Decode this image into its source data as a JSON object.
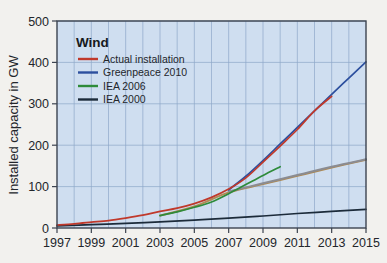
{
  "figure": {
    "background_color": "#f2f1ee",
    "plot_background_color": "#cfdef0",
    "frame_color": "#3c4450",
    "grid_color": "#8ea8c8"
  },
  "legend": {
    "title": "Wind",
    "position": "top-left-inside",
    "entries": [
      {
        "label": "Actual installation",
        "color": "#c0392b",
        "swatch_name": "legend-swatch-actual-installation"
      },
      {
        "label": "Greenpeace 2010",
        "color": "#2c4f9e",
        "swatch_name": "legend-swatch-greenpeace-2010"
      },
      {
        "label": "IEA 2006",
        "color": "#2e8b3a",
        "swatch_name": "legend-swatch-iea-2006"
      },
      {
        "label": "IEA 2000",
        "color": "#1c2b3a",
        "swatch_name": "legend-swatch-iea-2000"
      }
    ]
  },
  "chart_data": {
    "type": "line",
    "title": "Wind",
    "xlabel": "",
    "ylabel": "Installed capacity in GW",
    "xlim": [
      1997,
      2015
    ],
    "ylim": [
      0,
      500
    ],
    "grid": true,
    "legend_position": "top-left-inside",
    "x_ticks": [
      1997,
      1999,
      2001,
      2003,
      2005,
      2007,
      2009,
      2011,
      2013,
      2015
    ],
    "y_ticks": [
      0,
      100,
      200,
      300,
      400,
      500
    ],
    "x_minor_gridlines": [
      1998,
      2000,
      2002,
      2004,
      2006,
      2008,
      2010,
      2012,
      2014
    ],
    "series": [
      {
        "name": "Actual installation",
        "color": "#c0392b",
        "x": [
          1997,
          1998,
          1999,
          2000,
          2001,
          2002,
          2003,
          2004,
          2005,
          2006,
          2007,
          2008,
          2009,
          2010,
          2011,
          2012,
          2013
        ],
        "values": [
          7,
          10,
          14,
          18,
          24,
          31,
          40,
          48,
          59,
          74,
          94,
          121,
          159,
          198,
          238,
          283,
          318
        ]
      },
      {
        "name": "Greenpeace 2010",
        "color": "#2c4f9e",
        "x": [
          2007,
          2008,
          2009,
          2010,
          2011,
          2012,
          2013,
          2014,
          2015
        ],
        "values": [
          92,
          125,
          163,
          203,
          243,
          283,
          323,
          362,
          401
        ]
      },
      {
        "name": "IEA 2006",
        "color": "#2e8b3a",
        "x": [
          2003,
          2004,
          2005,
          2006,
          2007,
          2008,
          2009,
          2010
        ],
        "values": [
          30,
          39,
          50,
          63,
          83,
          105,
          127,
          148
        ]
      },
      {
        "name": "IEA 2000",
        "color": "#1c2b3a",
        "x": [
          1997,
          1999,
          2001,
          2003,
          2005,
          2007,
          2009,
          2011,
          2013,
          2015
        ],
        "values": [
          5,
          8,
          11,
          15,
          19,
          24,
          29,
          35,
          40,
          45
        ]
      },
      {
        "name": "projection-extension",
        "color": "#b08a52",
        "x": [
          2003,
          2005,
          2007,
          2009,
          2011,
          2013,
          2015
        ],
        "values": [
          30,
          52,
          86,
          106,
          126,
          146,
          165
        ]
      },
      {
        "name": "projection-extension-grey",
        "color": "#8b8c92",
        "x": [
          2007,
          2009,
          2011,
          2013,
          2015
        ],
        "values": [
          88,
          108,
          128,
          148,
          166
        ]
      }
    ]
  },
  "axes": {
    "y_title": "Installed capacity in GW",
    "y_tick_labels": [
      "0",
      "100",
      "200",
      "300",
      "400",
      "500"
    ],
    "x_tick_labels": [
      "1997",
      "1999",
      "2001",
      "2003",
      "2005",
      "2007",
      "2009",
      "2011",
      "2013",
      "2015"
    ]
  }
}
